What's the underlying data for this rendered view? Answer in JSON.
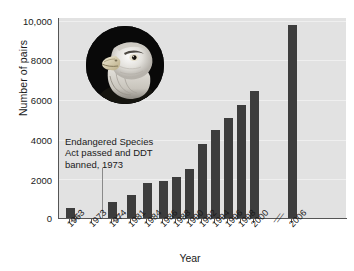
{
  "chart_data": {
    "type": "bar",
    "title": "",
    "xlabel": "Year",
    "ylabel": "Number of pairs",
    "ylim": [
      0,
      10000
    ],
    "yticks": [
      "0",
      "2000",
      "4000",
      "6000",
      "8000",
      "10,000"
    ],
    "ytick_values": [
      0,
      2000,
      4000,
      6000,
      8000,
      10000
    ],
    "grid": true,
    "legend": "none",
    "axis_breaks": [
      "after 1963",
      "after 1974",
      "after 2000"
    ],
    "categories": [
      "1963",
      "1973",
      "1974",
      "1981",
      "1984",
      "1986",
      "1988",
      "1990",
      "1992",
      "1994",
      "1996",
      "1998",
      "2000",
      "2006"
    ],
    "values": [
      487,
      null,
      791,
      1188,
      1757,
      1875,
      2075,
      2475,
      3749,
      4449,
      5094,
      5748,
      6471,
      9789
    ],
    "bar_values_detail": [
      {
        "year": "1963",
        "pairs": 487
      },
      {
        "year": "1973",
        "pairs": null
      },
      {
        "year": "1974",
        "pairs": 791
      },
      {
        "year": "1981",
        "pairs": 1188
      },
      {
        "year": "1984",
        "pairs": 1757
      },
      {
        "year": "1986",
        "pairs": 1875
      },
      {
        "year": "1988",
        "pairs": 2075
      },
      {
        "year": "1989",
        "pairs": 2400
      },
      {
        "year": "1990",
        "pairs": 2680
      },
      {
        "year": "1991",
        "pairs": 3020
      },
      {
        "year": "1992",
        "pairs": 3350
      },
      {
        "year": "1993",
        "pairs": 3749
      },
      {
        "year": "1994",
        "pairs": 4015
      },
      {
        "year": "1995",
        "pairs": 4449
      },
      {
        "year": "1996",
        "pairs": 4712
      },
      {
        "year": "1997",
        "pairs": 5094
      },
      {
        "year": "1998",
        "pairs": 5295
      },
      {
        "year": "1999",
        "pairs": 5748
      },
      {
        "year": "2000",
        "pairs": 6471
      },
      {
        "year": "2006",
        "pairs": 9789
      }
    ],
    "annotation": {
      "line1": "Endangered Species",
      "line2": "Act passed and DDT",
      "line3": "banned, 1973",
      "points_to_year": "1973"
    },
    "colors": {
      "bar": "#3d3d3d",
      "plot_background": "#e2e2e2",
      "gridline": "#efefef",
      "axis": "#555555",
      "text": "#1a1a1a",
      "page_background": "#ffffff"
    },
    "image": {
      "name": "bald-eagle-photo",
      "shape": "circle",
      "description": "Bald eagle head photograph"
    }
  }
}
